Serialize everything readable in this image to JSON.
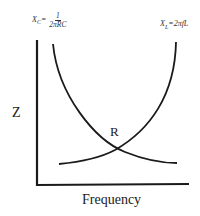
{
  "diagram": {
    "title": "",
    "x_axis_label": "Frequency",
    "y_axis_label": "Z",
    "intersection_label": "R",
    "curves": [
      {
        "name": "capacitive-reactance",
        "formula_lhs": "X",
        "formula_sub": "C",
        "formula_eq": "=",
        "formula_num": "1",
        "formula_den": "2πRC"
      },
      {
        "name": "inductive-reactance",
        "formula_text": "X",
        "formula_sub": "L",
        "formula_rhs": "=2πfL"
      }
    ],
    "colors": {
      "line": "#1a1a1a",
      "background": "#ffffff"
    }
  }
}
